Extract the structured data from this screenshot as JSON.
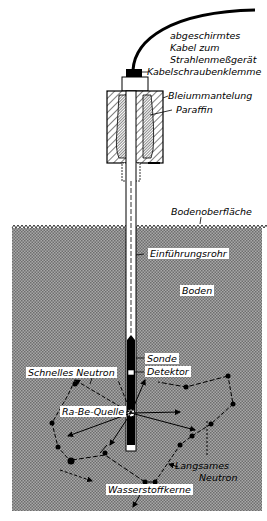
{
  "diagram": {
    "labels": {
      "cable": [
        "abgeschirmtes",
        "Kabel zum",
        "Strahlenmeßgerät"
      ],
      "cable_clamp": "Kabelschraubenklemme",
      "lead_shield": "Bleiummantelung",
      "paraffin": "Paraffin",
      "ground_surface": "Bodenoberfläche",
      "access_tube": "Einführungsrohr",
      "soil": "Boden",
      "probe": "Sonde",
      "detector": "Detektor",
      "fast_neutron": "Schnelles Neutron",
      "source": "Ra-Be-Quelle",
      "slow_neutron": [
        "Langsames",
        "Neutron"
      ],
      "hydrogen_nuclei": "Wasserstoffkerne"
    },
    "colors": {
      "soil_fill": "#8c8c8c",
      "ink": "#000000",
      "background": "#ffffff"
    }
  }
}
